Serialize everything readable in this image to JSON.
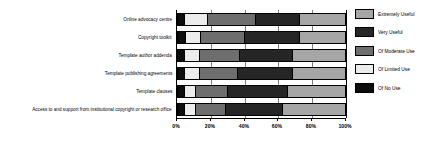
{
  "chart_data": {
    "type": "bar",
    "orientation": "horizontal",
    "stacked": true,
    "stack_mode": "percent",
    "title": "",
    "subtitle": "",
    "xlabel": "",
    "ylabel": "",
    "xlim": [
      0,
      100
    ],
    "grid": true,
    "legend_position": "right",
    "xticks": [
      "0%",
      "20%",
      "40%",
      "60%",
      "80%",
      "100%"
    ],
    "xtick_values": [
      0,
      20,
      40,
      60,
      80,
      100
    ],
    "categories": [
      "Online advocacy centre",
      "Copyright toolkit",
      "Template author addenda",
      "Template publishing agreements",
      "Template clauses",
      "Access to and support from institutional copyright or research office"
    ],
    "series": [
      {
        "name": "Of No Use",
        "color": "#0d0d0d",
        "values": [
          4,
          5,
          4,
          4,
          4,
          4
        ]
      },
      {
        "name": "Of Limited Use",
        "color": "#ededed",
        "values": [
          14,
          9,
          9,
          9,
          7,
          7
        ]
      },
      {
        "name": "Of Moderate Use",
        "color": "#6e6e6e",
        "values": [
          29,
          26,
          24,
          23,
          19,
          18
        ]
      },
      {
        "name": "Very Useful",
        "color": "#262626",
        "values": [
          26,
          33,
          32,
          33,
          36,
          34
        ]
      },
      {
        "name": "Extremely Useful",
        "color": "#a6a6a6",
        "values": [
          27,
          27,
          31,
          31,
          34,
          37
        ]
      }
    ],
    "legend_entries": [
      {
        "label": "Extremely Useful",
        "color": "#a6a6a6"
      },
      {
        "label": "Very Useful",
        "color": "#262626"
      },
      {
        "label": "Of Moderate Use",
        "color": "#6e6e6e"
      },
      {
        "label": "Of Limited Use",
        "color": "#ededed"
      },
      {
        "label": "Of No Use",
        "color": "#0d0d0d"
      }
    ],
    "colors": {
      "axis": "#000000",
      "gridline": "#7d7d7d",
      "background": "#ffffff",
      "text": "#000000"
    }
  }
}
